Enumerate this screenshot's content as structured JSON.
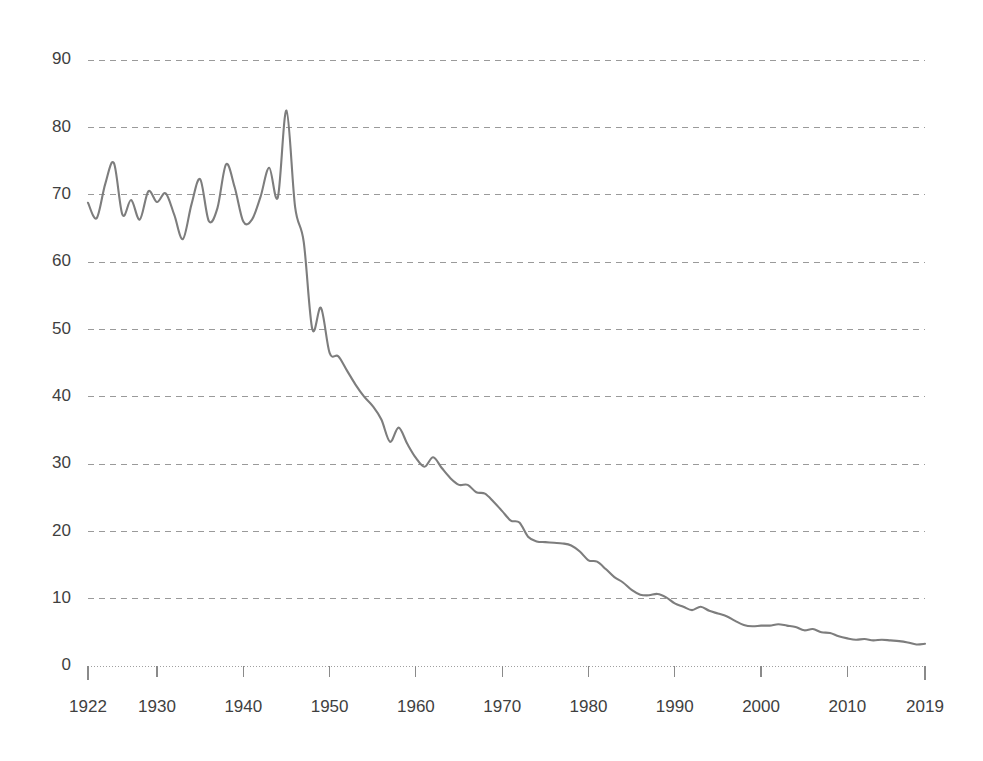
{
  "chart_data": {
    "type": "line",
    "title": "",
    "subtitle": "",
    "xlabel": "",
    "ylabel": "",
    "xlim": [
      1922,
      2019
    ],
    "ylim": [
      0,
      90
    ],
    "grid": true,
    "grid_axis": "y",
    "legend": false,
    "legend_position": "none",
    "line_color": "#7d7d7d",
    "background_color": "#ffffff",
    "text_color": "#3f3f3f",
    "gridline_color": "#9a9a9a",
    "ytick_labels": [
      "90",
      "80",
      "70",
      "60",
      "50",
      "40",
      "30",
      "20",
      "10",
      "0"
    ],
    "yticks": [
      90,
      80,
      70,
      60,
      50,
      40,
      30,
      20,
      10,
      0
    ],
    "xtick_labels": [
      "1922",
      "1930",
      "1940",
      "1950",
      "1960",
      "1970",
      "1980",
      "1990",
      "2000",
      "2010",
      "2019"
    ],
    "xticks": [
      1922,
      1930,
      1940,
      1950,
      1960,
      1970,
      1980,
      1990,
      2000,
      2010,
      2019
    ],
    "series": [
      {
        "name": "value",
        "x": [
          1922,
          1923,
          1924,
          1925,
          1926,
          1927,
          1928,
          1929,
          1930,
          1931,
          1932,
          1933,
          1934,
          1935,
          1936,
          1937,
          1938,
          1939,
          1940,
          1941,
          1942,
          1943,
          1944,
          1945,
          1946,
          1947,
          1948,
          1949,
          1950,
          1951,
          1952,
          1953,
          1954,
          1955,
          1956,
          1957,
          1958,
          1959,
          1960,
          1961,
          1962,
          1963,
          1964,
          1965,
          1966,
          1967,
          1968,
          1969,
          1970,
          1971,
          1972,
          1973,
          1974,
          1975,
          1976,
          1977,
          1978,
          1979,
          1980,
          1981,
          1982,
          1983,
          1984,
          1985,
          1986,
          1987,
          1988,
          1989,
          1990,
          1991,
          1992,
          1993,
          1994,
          1995,
          1996,
          1997,
          1998,
          1999,
          2000,
          2001,
          2002,
          2003,
          2004,
          2005,
          2006,
          2007,
          2008,
          2009,
          2010,
          2011,
          2012,
          2013,
          2014,
          2015,
          2016,
          2017,
          2018,
          2019
        ],
        "values": [
          68.8,
          66.5,
          71.6,
          74.7,
          67.0,
          69.2,
          66.3,
          70.5,
          68.9,
          70.2,
          67.0,
          63.4,
          68.6,
          72.3,
          66.1,
          68.0,
          74.5,
          71.1,
          66.0,
          66.3,
          69.7,
          74.0,
          69.6,
          82.5,
          68.2,
          63.0,
          50.0,
          53.2,
          46.5,
          46.0,
          43.9,
          41.8,
          40.0,
          38.6,
          36.6,
          33.3,
          35.4,
          33.0,
          30.9,
          29.6,
          31.0,
          29.4,
          27.9,
          26.9,
          26.9,
          25.8,
          25.6,
          24.4,
          23.0,
          21.6,
          21.3,
          19.2,
          18.5,
          18.4,
          18.3,
          18.2,
          17.9,
          17.0,
          15.7,
          15.5,
          14.4,
          13.2,
          12.4,
          11.3,
          10.6,
          10.5,
          10.7,
          10.2,
          9.3,
          8.8,
          8.3,
          8.8,
          8.2,
          7.8,
          7.4,
          6.7,
          6.1,
          5.9,
          6.0,
          6.0,
          6.2,
          6.0,
          5.8,
          5.3,
          5.5,
          5.0,
          4.9,
          4.4,
          4.1,
          3.9,
          4.0,
          3.8,
          3.9,
          3.8,
          3.7,
          3.5,
          3.2,
          3.3
        ]
      }
    ]
  }
}
